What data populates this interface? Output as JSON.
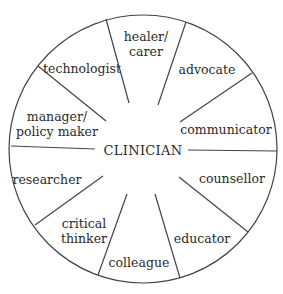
{
  "diagram": {
    "center": "CLINICIAN",
    "stroke_color": "#444444",
    "roles": [
      {
        "line1": "healer/",
        "line2": "carer"
      },
      {
        "line1": "advocate"
      },
      {
        "line1": "communicator"
      },
      {
        "line1": "counsellor"
      },
      {
        "line1": "educator"
      },
      {
        "line1": "colleague"
      },
      {
        "line1": "critical",
        "line2": "thinker"
      },
      {
        "line1": "researcher"
      },
      {
        "line1": "manager/",
        "line2": "policy maker"
      },
      {
        "line1": "technologist"
      }
    ]
  }
}
